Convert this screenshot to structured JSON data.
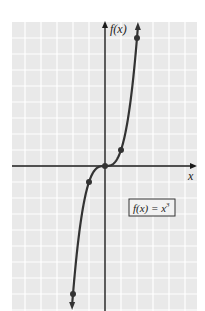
{
  "chart_data": {
    "type": "line",
    "title": "",
    "function_label": "f(x) = x³",
    "function_label_parts": {
      "fx": "f(x) = x",
      "exp": "3"
    },
    "xlabel": "x",
    "ylabel": "f(x)",
    "x": [
      -2,
      -1,
      0,
      1,
      2
    ],
    "series": [
      {
        "name": "f(x) = x^3",
        "values": [
          -8,
          -1,
          0,
          1,
          8
        ]
      }
    ],
    "marked_points": [
      [
        -2,
        -8
      ],
      [
        -1,
        -1
      ],
      [
        0,
        0
      ],
      [
        1,
        1
      ],
      [
        2,
        8
      ]
    ],
    "xlim": [
      -5.8,
      5.7
    ],
    "ylim": [
      -9.1,
      9.0
    ],
    "grid": true,
    "arrows_on_curve_ends": true,
    "legend_position": "lower-right boxed label"
  },
  "colors": {
    "grid_background": "#e9e9e9",
    "grid_lines": "#ffffff",
    "axis": "#1a1a1a",
    "curve": "#333333",
    "label_box_border": "#333333",
    "label_box_fill": "#f2f2f2"
  }
}
